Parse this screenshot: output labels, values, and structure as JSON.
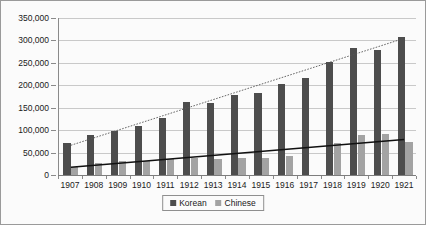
{
  "chart_data": {
    "type": "bar",
    "title": "",
    "subtitle": "",
    "xlabel": "",
    "ylabel": "",
    "categories": [
      "1907",
      "1908",
      "1909",
      "1910",
      "1911",
      "1912",
      "1913",
      "1914",
      "1915",
      "1916",
      "1917",
      "1918",
      "1919",
      "1920",
      "1921"
    ],
    "series": [
      {
        "name": "Korean",
        "color": "#4d4d4d",
        "values": [
          71000,
          90000,
          98000,
          110000,
          127000,
          162000,
          161000,
          179000,
          182000,
          203000,
          217000,
          252000,
          283000,
          278000,
          307000
        ]
      },
      {
        "name": "Chinese",
        "color": "#a3a3a3",
        "values": [
          18000,
          27000,
          32000,
          32000,
          36000,
          38000,
          36000,
          37000,
          38000,
          43000,
          0,
          71000,
          89000,
          92000,
          73000
        ]
      }
    ],
    "trendlines": [
      {
        "name": "Korean trendline",
        "style": "dotted",
        "color": "#555555",
        "start_value": 66000,
        "end_value": 305000
      },
      {
        "name": "Chinese trendline",
        "style": "solid",
        "color": "#111111",
        "start_value": 17000,
        "end_value": 79000
      }
    ],
    "ylim": [
      0,
      350000
    ],
    "ytick_values": [
      0,
      50000,
      100000,
      150000,
      200000,
      250000,
      300000,
      350000
    ],
    "ytick_labels": [
      "0",
      "50,000",
      "100,000",
      "150,000",
      "200,000",
      "250,000",
      "300,000",
      "350,000"
    ],
    "grid": "horizontal",
    "legend_position": "bottom"
  },
  "legend": {
    "entries": [
      {
        "label": "Korean"
      },
      {
        "label": "Chinese"
      }
    ]
  }
}
